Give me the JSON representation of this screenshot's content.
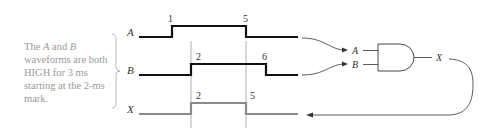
{
  "note": {
    "line1_pre": "The ",
    "line1_a": "A",
    "line1_mid": " and ",
    "line1_b": "B",
    "rest": "waveforms are both HIGH for 3 ms starting at the 2-ms mark."
  },
  "waveforms": {
    "a": {
      "label": "A",
      "rise_label": "1",
      "fall_label": "5"
    },
    "b": {
      "label": "B",
      "rise_label": "2",
      "fall_label": "6"
    },
    "x": {
      "label": "X",
      "rise_label": "2",
      "fall_label": "5"
    }
  },
  "gate": {
    "input_a": "A",
    "input_b": "B",
    "output": "X",
    "type": "AND"
  },
  "colors": {
    "wave": "#111111",
    "output_wave": "#8a8a8a",
    "guide": "#999999",
    "note_text": "#9a9a9a"
  }
}
